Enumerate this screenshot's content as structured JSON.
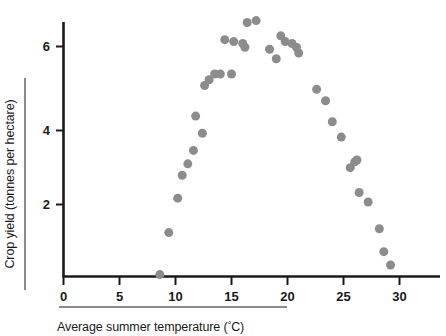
{
  "chart_data": {
    "type": "scatter",
    "title": "",
    "xlabel": "Average summer temperature (°C)",
    "ylabel": "Crop yield (tonnes per hectare)",
    "xlim": [
      0,
      34.8
    ],
    "ylim": [
      0,
      7.2
    ],
    "xticks": [
      0,
      5,
      10,
      15,
      20,
      25,
      30
    ],
    "yticks": [
      2,
      4,
      6
    ],
    "xtick_labels": [
      "0",
      "5",
      "10",
      "15",
      "20",
      "25",
      "30"
    ],
    "ytick_labels": [
      "2",
      "4",
      "6"
    ],
    "grid": false,
    "legend": null,
    "marker": {
      "shape": "circle",
      "color": "#8c8c8c",
      "size_px": 9
    },
    "series": [
      {
        "name": "Crop yield vs temperature",
        "points": [
          [
            8.6,
            0.05
          ],
          [
            9.4,
            1.15
          ],
          [
            10.2,
            2.05
          ],
          [
            10.6,
            2.65
          ],
          [
            11.1,
            2.95
          ],
          [
            11.6,
            3.3
          ],
          [
            11.8,
            4.2
          ],
          [
            12.4,
            3.75
          ],
          [
            12.6,
            5.0
          ],
          [
            13.0,
            5.15
          ],
          [
            13.5,
            5.3
          ],
          [
            14.0,
            5.3
          ],
          [
            15.0,
            5.3
          ],
          [
            14.4,
            6.2
          ],
          [
            15.2,
            6.15
          ],
          [
            16.0,
            6.1
          ],
          [
            16.2,
            6.0
          ],
          [
            16.4,
            6.65
          ],
          [
            17.2,
            6.7
          ],
          [
            18.4,
            5.95
          ],
          [
            19.0,
            5.7
          ],
          [
            19.4,
            6.3
          ],
          [
            19.8,
            6.15
          ],
          [
            20.4,
            6.1
          ],
          [
            20.8,
            6.0
          ],
          [
            21.0,
            5.85
          ],
          [
            22.6,
            4.9
          ],
          [
            23.4,
            4.6
          ],
          [
            24.0,
            4.05
          ],
          [
            24.8,
            3.65
          ],
          [
            25.6,
            2.85
          ],
          [
            26.0,
            3.0
          ],
          [
            26.2,
            3.05
          ],
          [
            26.4,
            2.2
          ],
          [
            27.2,
            1.95
          ],
          [
            28.2,
            1.25
          ],
          [
            28.6,
            0.65
          ],
          [
            29.2,
            0.3
          ]
        ]
      }
    ]
  },
  "axes": {
    "ylabel_text": "Crop yield (tonnes per hectare)",
    "xlabel_main": "Average summer temperature (",
    "xlabel_unit": "°",
    "xlabel_tail": "C)"
  },
  "colors": {
    "marker": "#8c8c8c",
    "axis": "#1a1a1a",
    "rule": "#8b8b8b",
    "background": "#ffffff"
  }
}
